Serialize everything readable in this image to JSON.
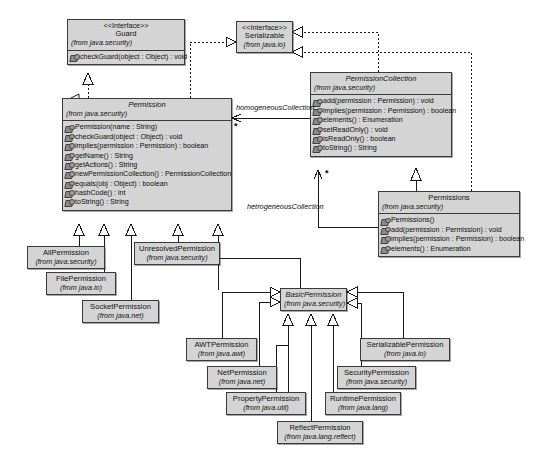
{
  "diagram": {
    "colors": {
      "node_fill": "#d4d4d4",
      "node_border": "#3a3a3a",
      "background": "#ffffff",
      "line": "#1a1a1a"
    },
    "stereotype_interface": "<<Interface>>",
    "method_icon": "method-icon"
  },
  "nodes": {
    "guard": {
      "stereotype": "<<Interface>>",
      "name": "Guard",
      "package": "(from java.security)",
      "methods": [
        "checkGuard(object : Object) : void"
      ]
    },
    "serializable": {
      "stereotype": "<<Interface>>",
      "name": "Serializable",
      "package": "(from java.io)",
      "methods": []
    },
    "permission": {
      "name": "Permission",
      "package": "(from java.security)",
      "methods": [
        "Permission(name : String)",
        "checkGuard(object : Object) : void",
        "implies(permission : Permission) : boolean",
        "getName() : String",
        "getActions() : String",
        "newPermissionCollection() : PermissionCollection",
        "equals(obj : Object) : boolean",
        "hashCode() : int",
        "toString() : String"
      ]
    },
    "permission_collection": {
      "name": "PermissionCollection",
      "package": "(from java.security)",
      "methods": [
        "add(permission : Permission) : void",
        "implies(permission : Permission) : boolean",
        "elements() : Enumeration",
        "setReadOnly() : void",
        "isReadOnly() : boolean",
        "toString() : String"
      ]
    },
    "permissions": {
      "name": "Permissions",
      "package": "(from java.security)",
      "methods": [
        "Permissions()",
        "add(permission : Permission) : void",
        "implies(permission : Permission) : boolean",
        "elements() : Enumeration"
      ]
    },
    "all_permission": {
      "name": "AllPermission",
      "package": "(from java.security)"
    },
    "file_permission": {
      "name": "FilePermission",
      "package": "(from java.io)"
    },
    "socket_permission": {
      "name": "SocketPermission",
      "package": "(from java.net)"
    },
    "unresolved_permission": {
      "name": "UnresolvedPermission",
      "package": "(from java.security)"
    },
    "basic_permission": {
      "name": "BasicPermission",
      "package": "(from java.security)"
    },
    "awt_permission": {
      "name": "AWTPermission",
      "package": "(from java.awt)"
    },
    "net_permission": {
      "name": "NetPermission",
      "package": "(from java.net)"
    },
    "property_permission": {
      "name": "PropertyPermission",
      "package": "(from java.util)"
    },
    "reflect_permission": {
      "name": "ReflectPermission",
      "package": "(from java.lang.reflect)"
    },
    "runtime_permission": {
      "name": "RuntimePermission",
      "package": "(from java.lang)"
    },
    "security_permission": {
      "name": "SecurityPermission",
      "package": "(from java.security)"
    },
    "serializable_permission": {
      "name": "SerializablePermission",
      "package": "(from java.io)"
    }
  },
  "edge_labels": {
    "homogeneous": "homogeneousCollection",
    "heterogeneous": "hetrogeneousCollection",
    "mult_permission": "*",
    "mult_collection": "*"
  }
}
